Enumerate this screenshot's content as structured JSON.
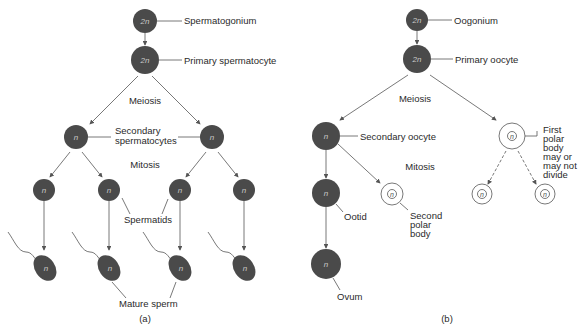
{
  "panel_a": {
    "caption": "(a)",
    "spermatogonium": {
      "label": "Spermatogonium",
      "ploidy": "2n"
    },
    "primary_spermatocyte": {
      "label": "Primary spermatocyte",
      "ploidy": "2n"
    },
    "meiosis_label": "Meiosis",
    "secondary_spermatocytes": {
      "label_line1": "Secondary",
      "label_line2": "spermatocytes",
      "ploidy": "n"
    },
    "mitosis_label": "Mitosis",
    "spermatids": {
      "label": "Spermatids",
      "ploidy": "n"
    },
    "mature_sperm": {
      "label": "Mature sperm",
      "ploidy": "n"
    }
  },
  "panel_b": {
    "caption": "(b)",
    "oogonium": {
      "label": "Oogonium",
      "ploidy": "2n"
    },
    "primary_oocyte": {
      "label": "Primary oocyte",
      "ploidy": "2n"
    },
    "meiosis_label": "Meiosis",
    "secondary_oocyte": {
      "label": "Secondary oocyte",
      "ploidy": "n"
    },
    "first_polar_body": {
      "label_lines": [
        "First",
        "polar",
        "body",
        "may or",
        "may not",
        "divide"
      ],
      "ploidy": "n"
    },
    "mitosis_label": "Mitosis",
    "ootid": {
      "label": "Ootid",
      "ploidy": "n"
    },
    "second_polar_body": {
      "label_lines": [
        "Second",
        "polar",
        "body"
      ],
      "ploidy": "n"
    },
    "ovum": {
      "label": "Ovum",
      "ploidy": "n"
    }
  },
  "colors": {
    "cell_fill": "#4a4a4a",
    "line": "#555555",
    "background": "#ffffff"
  }
}
